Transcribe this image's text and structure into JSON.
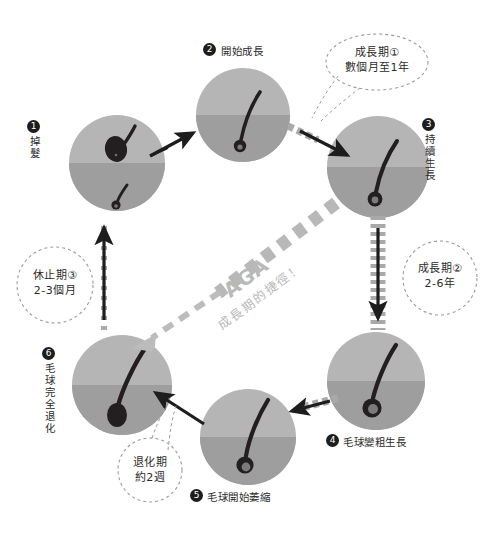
{
  "diagram": {
    "colors": {
      "circle_top": "#b5b5b5",
      "circle_bottom": "#9e9e9e",
      "hair": "#231f20",
      "bulb_accent": "#6f6f6f",
      "arrow_solid": "#1d1d1d",
      "arrow_dashed": "#9b9b9b",
      "callout_outline": "#9b9b9b",
      "aga_text": "#bdbdbd",
      "badge_bg": "#1d1d1d",
      "badge_text": "#ffffff",
      "label_text": "#2b2b2b",
      "background": "#ffffff"
    },
    "nodes": [
      {
        "id": "n1",
        "number": "❶",
        "num_plain": "1",
        "label": "掉髮",
        "orientation": "vertical",
        "cx": 117,
        "cy": 163,
        "r": 48
      },
      {
        "id": "n2",
        "number": "❷",
        "num_plain": "2",
        "label": "開始成長",
        "orientation": "horizontal",
        "cx": 243,
        "cy": 115,
        "r": 47
      },
      {
        "id": "n3",
        "number": "❸",
        "num_plain": "3",
        "label": "持續生長",
        "orientation": "vertical",
        "cx": 378,
        "cy": 167,
        "r": 51
      },
      {
        "id": "n4",
        "number": "❹",
        "num_plain": "4",
        "label": "毛球變粗生長",
        "orientation": "horizontal",
        "cx": 376,
        "cy": 381,
        "r": 49
      },
      {
        "id": "n5",
        "number": "❺",
        "num_plain": "5",
        "label": "毛球開始萎縮",
        "orientation": "horizontal",
        "cx": 248,
        "cy": 437,
        "r": 48
      },
      {
        "id": "n6",
        "number": "❻",
        "num_plain": "6",
        "label": "毛球完全退化",
        "orientation": "vertical",
        "cx": 122,
        "cy": 385,
        "r": 50
      }
    ],
    "callouts": [
      {
        "id": "c1",
        "lines": [
          "成長期①",
          "數個月至1年"
        ],
        "shape": "ellipse",
        "cx": 377,
        "cy": 62,
        "rx": 51,
        "ry": 28,
        "text_x": 322,
        "text_y": 46
      },
      {
        "id": "c2",
        "lines": [
          "成長期②",
          "2-6年"
        ],
        "shape": "circle",
        "cx": 440,
        "cy": 278,
        "rx": 37,
        "ry": 37,
        "text_x": 401,
        "text_y": 262
      },
      {
        "id": "c3",
        "lines": [
          "休止期③",
          "2-3個月"
        ],
        "shape": "circle",
        "cx": 55,
        "cy": 285,
        "rx": 39,
        "ry": 37,
        "text_x": 15,
        "text_y": 268
      },
      {
        "id": "c4",
        "lines": [
          "退化期",
          "約2週"
        ],
        "shape": "circle",
        "cx": 150,
        "cy": 470,
        "rx": 33,
        "ry": 31,
        "text_x": 118,
        "text_y": 456
      }
    ],
    "shortcut": {
      "id": "aga-shortcut",
      "main_label": "AGA",
      "sub_label": "成長期的捷徑！",
      "style": "dashed-arrow",
      "from_node": "n3",
      "to_node": "n6"
    },
    "connections": [
      {
        "id": "a1",
        "from": "n1",
        "to": "n2",
        "style": "solid"
      },
      {
        "id": "a2",
        "from": "n2",
        "to": "n3",
        "style": "solid-with-dashes"
      },
      {
        "id": "a3",
        "from": "n3",
        "to": "n4",
        "style": "solid-with-ticks"
      },
      {
        "id": "a4",
        "from": "n4",
        "to": "n5",
        "style": "solid-with-dashes"
      },
      {
        "id": "a5",
        "from": "n5",
        "to": "n6",
        "style": "solid"
      },
      {
        "id": "a6",
        "from": "n6",
        "to": "n1",
        "style": "solid-with-ticks"
      }
    ]
  }
}
